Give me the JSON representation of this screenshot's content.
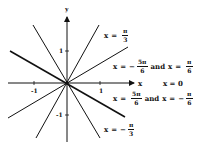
{
  "diagram": {
    "type": "polar-lines",
    "axes": {
      "x_label": "x",
      "y_label": "y",
      "ticks": {
        "x_pos": "1",
        "x_neg": "-1",
        "y_pos": "1",
        "y_neg": "-1"
      }
    },
    "lines": [
      {
        "name": "x = π/3",
        "angle_deg": 60
      },
      {
        "name": "x = -π/3",
        "angle_deg": -60
      },
      {
        "name": "x = -5π/6 and x = π/6",
        "angle_deg": 30
      },
      {
        "name": "x = 5π/6 and x = -π/6",
        "angle_deg": -30
      },
      {
        "name": "x = 0",
        "angle_deg": 0
      }
    ],
    "labels": {
      "l1": {
        "var": "x",
        "eq": "=",
        "sign": "",
        "num": "π",
        "den": "3"
      },
      "l2": {
        "var": "x",
        "eq": "=",
        "sign": "−",
        "num": "5π",
        "den": "6",
        "and": "and",
        "var2": "x",
        "eq2": "=",
        "sign2": "",
        "num2": "π",
        "den2": "6"
      },
      "l3": {
        "text": "x = 0"
      },
      "l4": {
        "var": "x",
        "eq": "=",
        "sign": "",
        "num": "5π",
        "den": "6",
        "and": "and",
        "var2": "x",
        "eq2": "=",
        "sign2": "−",
        "num2": "π",
        "den2": "6"
      },
      "l5": {
        "var": "x",
        "eq": "=",
        "sign": "−",
        "num": "π",
        "den": "3"
      }
    },
    "colors": {
      "ink": "#111111",
      "background": "#ffffff"
    }
  }
}
